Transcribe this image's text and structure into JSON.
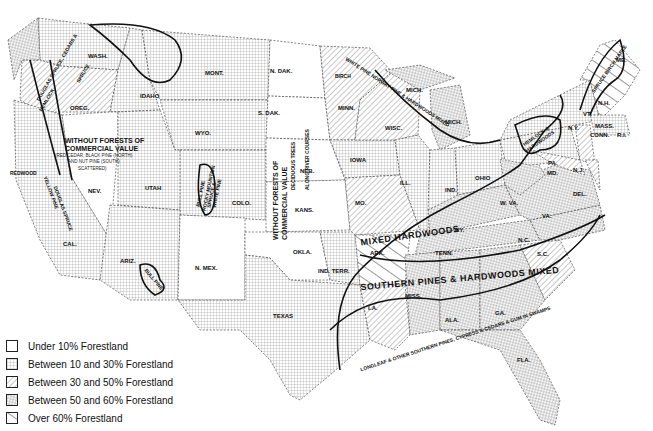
{
  "legend": {
    "items": [
      {
        "label": "Under 10% Forestland",
        "pattern": "none"
      },
      {
        "label": "Between 10 and 30% Forestland",
        "pattern": "grid"
      },
      {
        "label": "Between 30 and 50% Forestland",
        "pattern": "diag-fine"
      },
      {
        "label": "Between 50 and 60% Forestland",
        "pattern": "speckle"
      },
      {
        "label": "Over 60% Forestland",
        "pattern": "diag-wide"
      }
    ]
  },
  "states": {
    "wash": "WASH.",
    "oreg": "OREG.",
    "idaho": "IDAHO",
    "mont": "MONT.",
    "wyo": "WYO.",
    "nev": "NEV.",
    "utah": "UTAH",
    "colo": "COLO.",
    "cal": "CAL.",
    "ariz": "ARIZ.",
    "nmex": "N. MEX.",
    "ndak": "N. DAK.",
    "sdak": "S. DAK.",
    "neb": "NEB.",
    "kans": "KANS.",
    "okla": "OKLA.",
    "indterr": "IND. TERR.",
    "texas": "TEXAS",
    "minn": "MINN.",
    "iowa": "IOWA",
    "mo": "MO.",
    "ark": "ARK.",
    "la": "LA.",
    "wisc": "WISC.",
    "ill": "ILL.",
    "mich_upper": "MICH.",
    "mich_lower": "MICH.",
    "ind": "IND.",
    "ohio": "OHIO",
    "ky": "KY.",
    "tenn": "TENN.",
    "miss": "MISS.",
    "ala": "ALA.",
    "ga": "GA.",
    "fla": "FLA.",
    "sc": "S.C.",
    "nc": "N.C.",
    "va": "VA.",
    "wva": "W. VA.",
    "md": "MD.",
    "del": "DEL.",
    "nj": "N.J.",
    "pa": "PA.",
    "ny": "N.Y.",
    "conn": "CONN.",
    "ri": "R.I.",
    "mass": "MASS.",
    "vt": "VT.",
    "nh": "N.H.",
    "me": "ME."
  },
  "regions": {
    "without_forests_west": [
      "WITHOUT FORESTS OF",
      "COMMERCIAL VALUE"
    ],
    "west_note": [
      "(RED CEDAR, BLACK PINE (NORTH)",
      "AND NUT PINE (SOUTH)",
      "SCATTERED)"
    ],
    "without_forests_plains": [
      "WITHOUT FORESTS OF",
      "COMMERCIAL VALUE"
    ],
    "deciduous": [
      "DECIDUOUS TREES",
      "ALONG RIVER COURSES"
    ],
    "mixed_hardwoods": "MIXED HARDWOODS",
    "southern_pines": "SOUTHERN PINES & HARDWOODS MIXED",
    "longleaf": "LONGLEAF & OTHER SOUTHERN PINES, CYPRESS & CEDARS & GUM IN SWAMPS",
    "white_pine": "WHITE PINE NORWAY PINE & HARDWOODS MIXED",
    "birch": "BIRCH",
    "spruce": "SPRUCE BIRCH MAPLE",
    "hemlock": [
      "HEMLOCK &",
      "HARDWOODS"
    ],
    "douglas": [
      "DOUGLAS SPRUCE, CEDARS &",
      "HEMLOCK",
      "SPRUCE"
    ],
    "redwood": "REDWOOD",
    "yellow_pine": [
      "YELLOW PINE",
      "DOUGLAS SPRUCE"
    ],
    "bull_pine": [
      "BULL PINE"
    ],
    "rocky_pine": [
      "BULL PINE",
      "ROCKY MOUNTAIN",
      "SPRUCE &",
      "WHITE PINE"
    ]
  }
}
